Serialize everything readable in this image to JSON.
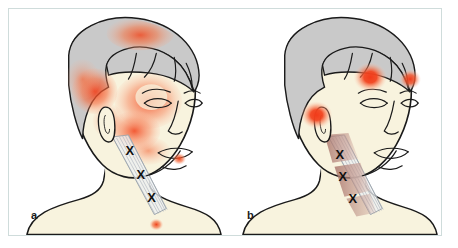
{
  "figure": {
    "type": "medical-illustration",
    "panel_count": 2,
    "frame_color": "#cfdcdb",
    "background_color": "#ffffff"
  },
  "palette": {
    "skin": "#f8f3de",
    "skin_shadow": "#efe6c9",
    "hair_gray": "#c9c9c9",
    "hair_gray_dark": "#b4b4b4",
    "outline": "#1a1a1a",
    "pain_red": "#f04a22",
    "pain_red_bright": "#f23b1a",
    "pain_orange": "#f7713f",
    "pain_wash": "#fbb89c",
    "referred_mauve": "#a9756b",
    "referred_mauve_light": "#c69b91",
    "muscle_fiber": "#cfd3d8"
  },
  "panels": [
    {
      "id": "a",
      "label": "a",
      "caption_letter": "a",
      "muscle": "sternocleidomastoid - sternal division",
      "trigger_points": [
        {
          "name": "trigger-point-1",
          "marker": "X",
          "x": 129,
          "y": 148
        },
        {
          "name": "trigger-point-2",
          "marker": "X",
          "x": 139,
          "y": 172
        },
        {
          "name": "trigger-point-3",
          "marker": "X",
          "x": 149,
          "y": 195
        }
      ],
      "pain_zones": [
        {
          "name": "vertex-pain-zone",
          "intensity": "diffuse"
        },
        {
          "name": "temporal-pain-zone",
          "intensity": "intense"
        },
        {
          "name": "occipital-pain-zone",
          "intensity": "intense"
        },
        {
          "name": "periorbital-pain-ring",
          "intensity": "intense"
        },
        {
          "name": "cheek-pain-zone",
          "intensity": "moderate"
        },
        {
          "name": "postauricular-pain-zone",
          "intensity": "moderate"
        },
        {
          "name": "jaw-pain-zone",
          "intensity": "moderate"
        },
        {
          "name": "chin-pain-spot",
          "intensity": "focal"
        },
        {
          "name": "sternal-notch-pain-spot",
          "intensity": "focal"
        }
      ]
    },
    {
      "id": "b",
      "label": "b",
      "caption_letter": "b",
      "muscle": "sternocleidomastoid - clavicular division",
      "trigger_points": [
        {
          "name": "trigger-point-1",
          "marker": "X",
          "x": 344,
          "y": 172
        },
        {
          "name": "trigger-point-2",
          "marker": "X",
          "x": 344,
          "y": 189
        },
        {
          "name": "trigger-point-3",
          "marker": "X",
          "x": 349,
          "y": 206
        }
      ],
      "pain_zones": [
        {
          "name": "frontal-pain-spot",
          "intensity": "focal-intense"
        },
        {
          "name": "supraorbital-pain-spot",
          "intensity": "focal-intense"
        },
        {
          "name": "auricular-pain-zone",
          "intensity": "focal-intense"
        },
        {
          "name": "referred-band-upper",
          "intensity": "deep-ache"
        },
        {
          "name": "referred-band-lower",
          "intensity": "deep-ache"
        }
      ]
    }
  ]
}
